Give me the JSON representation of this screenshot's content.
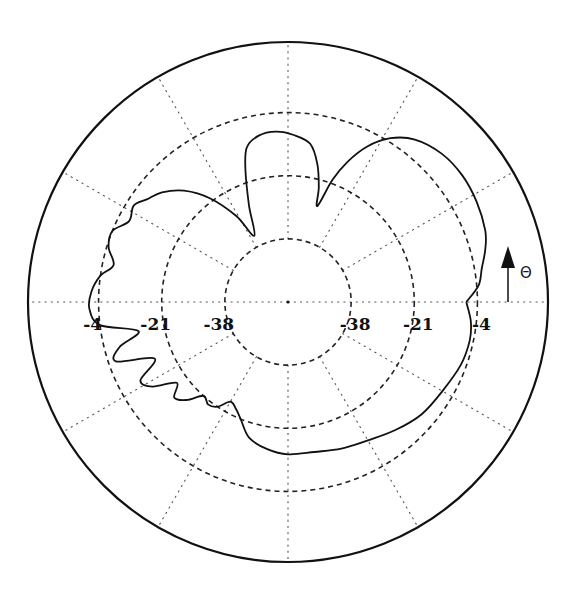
{
  "chart_data": {
    "type": "line",
    "subtype": "polar",
    "title": "",
    "xlabel": "",
    "ylabel": "",
    "angular_label": "Θ",
    "angle_convention": "degrees, counterclockwise from +x (right), 90 = top",
    "radial_unit": "dB",
    "radial_range": [
      -55,
      15
    ],
    "radial_ticks": [
      -38,
      -21,
      -4
    ],
    "radial_tick_labels_left": [
      "-4",
      "-21",
      "-38"
    ],
    "radial_tick_labels_right": [
      "-38",
      "-21",
      "-4"
    ],
    "angular_gridlines_deg": [
      0,
      30,
      60,
      90,
      120,
      150,
      180,
      210,
      240,
      270,
      300,
      330
    ],
    "grid": true,
    "legend": "none",
    "series": [
      {
        "name": "pattern",
        "note": "values estimated from the plotted curve",
        "points": [
          [
            0,
            -7
          ],
          [
            5,
            -3.5
          ],
          [
            10,
            -2
          ],
          [
            15,
            0
          ],
          [
            20,
            1.5
          ],
          [
            28,
            2.5
          ],
          [
            36,
            3
          ],
          [
            44,
            2.5
          ],
          [
            52,
            0.5
          ],
          [
            58,
            -3
          ],
          [
            63,
            -8
          ],
          [
            67,
            -14
          ],
          [
            70,
            -20
          ],
          [
            73,
            -28
          ],
          [
            75,
            -23
          ],
          [
            78,
            -17
          ],
          [
            82,
            -12
          ],
          [
            88,
            -10
          ],
          [
            94,
            -9
          ],
          [
            100,
            -9.5
          ],
          [
            105,
            -12
          ],
          [
            108,
            -18
          ],
          [
            112,
            -27
          ],
          [
            117,
            -35
          ],
          [
            121,
            -28
          ],
          [
            127,
            -20
          ],
          [
            133,
            -14
          ],
          [
            139,
            -10
          ],
          [
            144,
            -8
          ],
          [
            148,
            -6
          ],
          [
            153,
            -7
          ],
          [
            158,
            -4
          ],
          [
            163,
            -4.5
          ],
          [
            168,
            -7
          ],
          [
            172,
            -4
          ],
          [
            177,
            -2
          ],
          [
            182,
            -1.5
          ],
          [
            187,
            -4
          ],
          [
            191,
            -14
          ],
          [
            195,
            -8
          ],
          [
            199,
            -6
          ],
          [
            203,
            -16
          ],
          [
            208,
            -10
          ],
          [
            212,
            -12
          ],
          [
            216,
            -18
          ],
          [
            220,
            -15
          ],
          [
            224,
            -17
          ],
          [
            228,
            -21
          ],
          [
            232,
            -20
          ],
          [
            236,
            -21
          ],
          [
            240,
            -24
          ],
          [
            244,
            -23
          ],
          [
            248,
            -21
          ],
          [
            254,
            -17
          ],
          [
            262,
            -15
          ],
          [
            270,
            -14
          ],
          [
            280,
            -14
          ],
          [
            290,
            -13
          ],
          [
            300,
            -12
          ],
          [
            310,
            -10
          ],
          [
            320,
            -8
          ],
          [
            330,
            -7
          ],
          [
            340,
            -5.5
          ],
          [
            348,
            -5
          ],
          [
            354,
            -5.5
          ],
          [
            360,
            -7
          ]
        ]
      }
    ]
  },
  "annotations": {
    "theta_arrow": "up-arrow",
    "theta_symbol": "Θ"
  }
}
